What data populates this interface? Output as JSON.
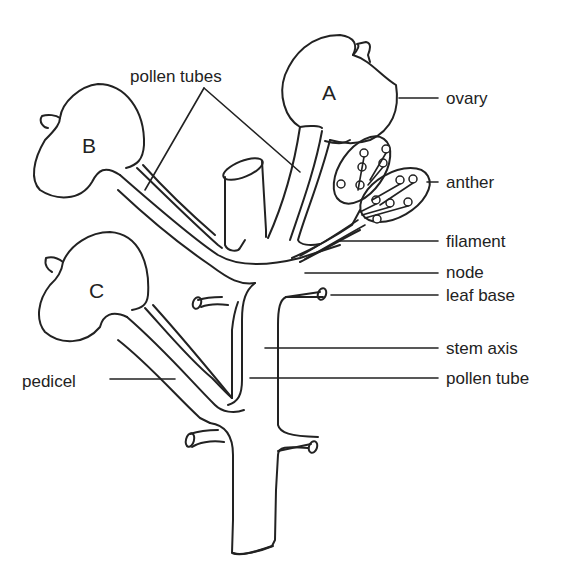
{
  "diagram": {
    "title": "",
    "flowers": [
      {
        "id": "A",
        "label": "A"
      },
      {
        "id": "B",
        "label": "B"
      },
      {
        "id": "C",
        "label": "C"
      }
    ],
    "labels": {
      "pollen_tubes": "pollen tubes",
      "ovary": "ovary",
      "anther": "anther",
      "filament": "filament",
      "node": "node",
      "leaf_base": "leaf base",
      "stem_axis": "stem axis",
      "pollen_tube": "pollen tube",
      "pedicel": "pedicel"
    },
    "colors": {
      "line": "#222222",
      "background": "#ffffff"
    }
  }
}
